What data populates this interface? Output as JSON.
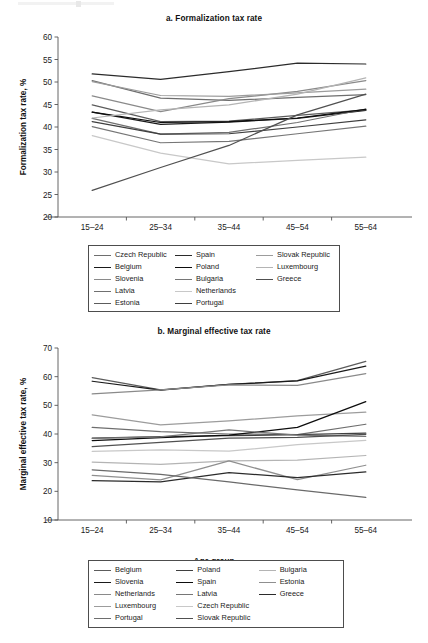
{
  "figure": {
    "background": "#ffffff",
    "width": 428,
    "height": 643
  },
  "panel_a": {
    "title": "a. Formalization tax rate",
    "ylabel": "Formalization tax rate, %",
    "xlabel": "Age group"
  },
  "panel_b": {
    "title": "b. Marginal effective tax rate",
    "ylabel": "Marginal effective tax rate, %",
    "xlabel": "Age group"
  },
  "legend_a": {
    "items": [
      {
        "label": "Czech Republic",
        "color": "#6e6e6e"
      },
      {
        "label": "Belgium",
        "color": "#1a1a1a"
      },
      {
        "label": "Slovenia",
        "color": "#8a8a8a"
      },
      {
        "label": "Latvia",
        "color": "#707070"
      },
      {
        "label": "Estonia",
        "color": "#5c5c5c"
      },
      {
        "label": "Spain",
        "color": "#2b2b2b"
      },
      {
        "label": "Poland",
        "color": "#0d0d0d"
      },
      {
        "label": "Bulgaria",
        "color": "#767676"
      },
      {
        "label": "Netherlands",
        "color": "#c8c8c8"
      },
      {
        "label": "Portugal",
        "color": "#3f3f3f"
      },
      {
        "label": "Slovak Republic",
        "color": "#9c9c9c"
      },
      {
        "label": "Luxembourg",
        "color": "#b4b4b4"
      },
      {
        "label": "Greece",
        "color": "#505050"
      }
    ]
  },
  "legend_b": {
    "items": [
      {
        "label": "Belgium",
        "color": "#5c5c5c"
      },
      {
        "label": "Slovenia",
        "color": "#1a1a1a"
      },
      {
        "label": "Netherlands",
        "color": "#8a8a8a"
      },
      {
        "label": "Luxembourg",
        "color": "#9c9c9c"
      },
      {
        "label": "Portugal",
        "color": "#6e6e6e"
      },
      {
        "label": "Poland",
        "color": "#3f3f3f"
      },
      {
        "label": "Spain",
        "color": "#0d0d0d"
      },
      {
        "label": "Latvia",
        "color": "#767676"
      },
      {
        "label": "Czech Republic",
        "color": "#c8c8c8"
      },
      {
        "label": "Slovak Republic",
        "color": "#505050"
      },
      {
        "label": "Bulgaria",
        "color": "#b4b4b4"
      },
      {
        "label": "Estonia",
        "color": "#8f8f8f"
      },
      {
        "label": "Greece",
        "color": "#2b2b2b"
      }
    ]
  },
  "chart_data": [
    {
      "type": "line",
      "id": "panel-a",
      "title": "a. Formalization tax rate",
      "xlabel": "Age group",
      "ylabel": "Formalization tax rate, %",
      "categories": [
        "15–24",
        "25–34",
        "35–44",
        "45–54",
        "55–64"
      ],
      "ylim": [
        20,
        60
      ],
      "yticks": [
        20,
        25,
        30,
        35,
        40,
        45,
        50,
        55,
        60
      ],
      "grid": false,
      "legend_position": "below",
      "series": [
        {
          "name": "Czech Republic",
          "color": "#6e6e6e",
          "values": [
            50.3,
            46.4,
            45.9,
            46.6,
            47.2
          ]
        },
        {
          "name": "Belgium",
          "color": "#1a1a1a",
          "values": [
            43.3,
            40.6,
            41.1,
            41.9,
            43.7
          ]
        },
        {
          "name": "Slovenia",
          "color": "#8a8a8a",
          "values": [
            46.9,
            43.4,
            46.3,
            47.9,
            50.3
          ]
        },
        {
          "name": "Latvia",
          "color": "#707070",
          "values": [
            41.9,
            38.4,
            38.8,
            41.0,
            44.0
          ]
        },
        {
          "name": "Estonia",
          "color": "#5c5c5c",
          "values": [
            44.9,
            41.2,
            41.3,
            42.6,
            43.8
          ]
        },
        {
          "name": "Spain",
          "color": "#2b2b2b",
          "values": [
            51.8,
            50.6,
            52.3,
            54.2,
            54.0
          ]
        },
        {
          "name": "Poland",
          "color": "#0d0d0d",
          "values": [
            43.3,
            41.0,
            41.2,
            42.0,
            43.9
          ]
        },
        {
          "name": "Bulgaria",
          "color": "#767676",
          "values": [
            40.1,
            36.5,
            36.8,
            38.5,
            40.2
          ]
        },
        {
          "name": "Netherlands",
          "color": "#c8c8c8",
          "values": [
            38.1,
            34.2,
            31.8,
            32.6,
            33.3
          ]
        },
        {
          "name": "Portugal",
          "color": "#3f3f3f",
          "values": [
            41.2,
            38.4,
            38.5,
            40.0,
            41.6
          ]
        },
        {
          "name": "Slovak Republic",
          "color": "#9c9c9c",
          "values": [
            50.1,
            47.0,
            46.8,
            47.6,
            48.4
          ]
        },
        {
          "name": "Luxembourg",
          "color": "#b4b4b4",
          "values": [
            42.0,
            43.8,
            44.9,
            47.3,
            50.9
          ]
        },
        {
          "name": "Greece",
          "color": "#505050",
          "values": [
            25.9,
            31.0,
            35.9,
            42.7,
            47.3
          ]
        }
      ]
    },
    {
      "type": "line",
      "id": "panel-b",
      "title": "b. Marginal effective tax rate",
      "xlabel": "Age group",
      "ylabel": "Marginal effective tax rate, %",
      "categories": [
        "15–24",
        "25–34",
        "35–44",
        "45–54",
        "55–64"
      ],
      "ylim": [
        10,
        70
      ],
      "yticks": [
        10,
        20,
        30,
        40,
        50,
        60,
        70
      ],
      "grid": false,
      "legend_position": "below",
      "series": [
        {
          "name": "Belgium",
          "color": "#5c5c5c",
          "values": [
            59.7,
            55.4,
            57.3,
            58.6,
            65.3
          ]
        },
        {
          "name": "Slovenia",
          "color": "#1a1a1a",
          "values": [
            58.4,
            55.3,
            57.3,
            58.5,
            63.7
          ]
        },
        {
          "name": "Netherlands",
          "color": "#8a8a8a",
          "values": [
            54.0,
            55.4,
            57.1,
            57.0,
            61.1
          ]
        },
        {
          "name": "Luxembourg",
          "color": "#9c9c9c",
          "values": [
            46.7,
            43.2,
            44.6,
            46.3,
            47.6
          ]
        },
        {
          "name": "Portugal",
          "color": "#6e6e6e",
          "values": [
            42.3,
            40.8,
            40.0,
            39.8,
            43.4
          ]
        },
        {
          "name": "Poland",
          "color": "#3f3f3f",
          "values": [
            38.6,
            39.1,
            39.4,
            39.8,
            40.3
          ]
        },
        {
          "name": "Spain",
          "color": "#0d0d0d",
          "values": [
            37.7,
            38.7,
            39.6,
            42.3,
            51.3
          ]
        },
        {
          "name": "Latvia",
          "color": "#767676",
          "values": [
            38.5,
            39.0,
            41.4,
            39.6,
            39.2
          ]
        },
        {
          "name": "Czech Republic",
          "color": "#c8c8c8",
          "values": [
            33.9,
            34.5,
            34.0,
            36.3,
            37.8
          ]
        },
        {
          "name": "Slovak Republic",
          "color": "#505050",
          "values": [
            35.6,
            37.1,
            38.6,
            38.8,
            39.9
          ]
        },
        {
          "name": "Bulgaria",
          "color": "#b4b4b4",
          "values": [
            30.2,
            29.4,
            30.6,
            30.9,
            32.5
          ]
        },
        {
          "name": "Estonia",
          "color": "#8f8f8f",
          "values": [
            25.6,
            24.0,
            30.6,
            24.1,
            29.1
          ]
        },
        {
          "name": "Greece",
          "color": "#2b2b2b",
          "values": [
            23.7,
            23.3,
            26.5,
            24.8,
            26.8
          ]
        },
        {
          "name": "Greece-declining",
          "color": "#6a6a6a",
          "values": [
            27.5,
            25.9,
            23.3,
            20.5,
            17.9
          ]
        }
      ]
    }
  ]
}
